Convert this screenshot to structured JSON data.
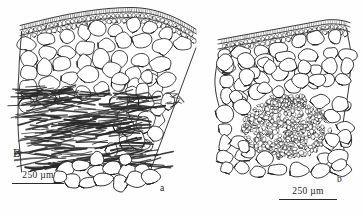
{
  "figure": {
    "kind": "scientific-line-drawing",
    "panel_label": "B",
    "background_color": "#fefefe",
    "ink_color": "#232323",
    "width_px": 363,
    "height_px": 217,
    "subfigures": [
      {
        "id": "a",
        "label": "a",
        "label_position": {
          "x": 160,
          "y": 183
        },
        "description": "transverse section of leaf-like organ; cuticle and papillate epidermis at top, large rounded parenchyma cells beneath, broad band of dark elongated fibres in lower half, rounded cells at base",
        "scale_bar": {
          "label": "250 µm",
          "value": 250,
          "unit": "µm",
          "length_px": 52
        }
      },
      {
        "id": "b",
        "label": "b",
        "label_position": {
          "x": 337,
          "y": 174
        },
        "description": "transverse section with cuticle and small epidermal cells at top, large rounded parenchyma cells, central dense cluster of very small fibre cells, rounded cells at base",
        "scale_bar": {
          "label": "250 µm",
          "value": 250,
          "unit": "µm",
          "length_px": 58
        }
      }
    ],
    "scale_bars": {
      "left": {
        "label": "250 µm",
        "value": 250,
        "unit": "µm"
      },
      "right": {
        "label": "250 µm",
        "value": 250,
        "unit": "µm"
      }
    }
  },
  "chart_data": {
    "type": "table",
    "title": "",
    "note": "Line-drawing figure: two anatomical cross sections (a, b) of panel B, each with a 250 micrometre scale bar.",
    "columns": [
      "subfigure",
      "scale bar",
      "panel"
    ],
    "rows": [
      [
        "a",
        "250 µm",
        "B"
      ],
      [
        "b",
        "250 µm",
        "B"
      ]
    ]
  },
  "geometry": {
    "panel_a": {
      "outline_left_top": {
        "x": 22,
        "y": 27
      },
      "outline_right_top": {
        "x": 196,
        "y": 48
      },
      "cuticle_arc": [
        [
          20,
          30
        ],
        [
          60,
          17
        ],
        [
          110,
          12
        ],
        [
          155,
          20
        ],
        [
          197,
          42
        ]
      ],
      "epidermis_arc": [
        [
          21,
          36
        ],
        [
          62,
          24
        ],
        [
          110,
          19
        ],
        [
          154,
          28
        ],
        [
          196,
          50
        ]
      ],
      "left_edge": [
        [
          22,
          36
        ],
        [
          20,
          52
        ],
        [
          33,
          60
        ],
        [
          26,
          78
        ],
        [
          30,
          100
        ],
        [
          37,
          120
        ],
        [
          44,
          148
        ],
        [
          52,
          168
        ],
        [
          66,
          182
        ]
      ],
      "right_edge": [
        [
          196,
          50
        ],
        [
          186,
          64
        ],
        [
          190,
          80
        ],
        [
          176,
          96
        ],
        [
          178,
          112
        ],
        [
          166,
          128
        ],
        [
          160,
          150
        ],
        [
          150,
          170
        ],
        [
          140,
          182
        ]
      ],
      "fibre_band_top": 96,
      "fibre_band_bottom": 168,
      "parenchyma_rows": 7,
      "basal_cell_row_y": 178
    },
    "panel_b": {
      "cuticle_arc": [
        [
          222,
          42
        ],
        [
          250,
          28
        ],
        [
          285,
          20
        ],
        [
          320,
          17
        ],
        [
          345,
          18
        ]
      ],
      "epidermis_arc": [
        [
          223,
          49
        ],
        [
          252,
          36
        ],
        [
          286,
          28
        ],
        [
          320,
          25
        ],
        [
          345,
          26
        ]
      ],
      "left_edge": [
        [
          222,
          50
        ],
        [
          216,
          70
        ],
        [
          222,
          92
        ],
        [
          214,
          112
        ],
        [
          220,
          134
        ],
        [
          226,
          152
        ],
        [
          236,
          168
        ]
      ],
      "right_edge": [
        [
          345,
          28
        ],
        [
          349,
          52
        ],
        [
          343,
          76
        ],
        [
          350,
          100
        ],
        [
          344,
          124
        ],
        [
          350,
          148
        ],
        [
          340,
          166
        ]
      ],
      "dense_cluster": {
        "cx": 286,
        "cy": 128,
        "rx": 44,
        "ry": 30
      },
      "basal_cell_row_y": 162
    }
  }
}
